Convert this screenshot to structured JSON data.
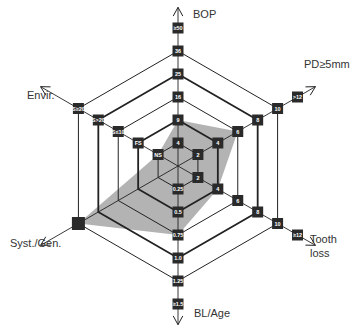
{
  "diagram": {
    "type": "risk-hexagon",
    "center": [
      178,
      166
    ],
    "ring_step": 23,
    "colors": {
      "line": "#222222",
      "box": "#2a2a2a",
      "box_text": "#ffffff",
      "patient_area": "#b3b3b3",
      "label": "#333333"
    },
    "axes": [
      {
        "name": "BOP",
        "angle": -90,
        "values": [
          "4",
          "9",
          "16",
          "25",
          "36",
          "≥50"
        ]
      },
      {
        "name": "PD≥5mm",
        "angle": -30,
        "values": [
          "2",
          "4",
          "6",
          "8",
          "10",
          ">12"
        ]
      },
      {
        "name": "Tooth loss",
        "angle": 30,
        "values": [
          "2",
          "4",
          "6",
          "8",
          "10",
          "≥12"
        ]
      },
      {
        "name": "BL/Age",
        "angle": 90,
        "values": [
          "0.25",
          "0.5",
          "0.75",
          "1.0",
          "1.25",
          "≥1.5"
        ]
      },
      {
        "name": "Syst./Gen.",
        "angle": 150,
        "values": [
          "",
          "",
          "",
          "",
          "",
          ""
        ]
      },
      {
        "name": "Envir.",
        "angle": 210,
        "values": [
          "NS",
          "FS",
          "S≤10",
          "S>20",
          "S≥20",
          ""
        ]
      }
    ],
    "labels": {
      "bop": "BOP",
      "pd": "PD≥5mm",
      "tooth_line1": "Tooth",
      "tooth_line2": "loss",
      "bl": "BL/Age",
      "syst": "Syst./Gen.",
      "envir": "Envir."
    },
    "patient_polygon": [
      {
        "axis": "BOP",
        "value": "9"
      },
      {
        "axis": "PD≥5mm",
        "value": "6"
      },
      {
        "axis": "Tooth loss",
        "value": "4"
      },
      {
        "axis": "BL/Age",
        "value": "0.75"
      },
      {
        "axis": "Syst./Gen.",
        "value": "positive"
      },
      {
        "axis": "Envir.",
        "value": "NS"
      }
    ]
  }
}
